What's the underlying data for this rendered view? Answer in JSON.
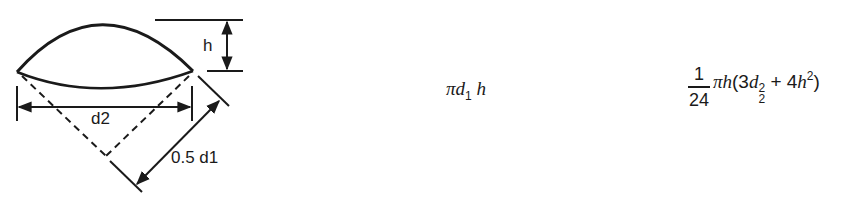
{
  "figure": {
    "labels": {
      "height": "h",
      "chord": "d2",
      "radius": "0.5 d1"
    },
    "stroke_color": "#1a1a1a"
  },
  "formulas": {
    "surface_area": {
      "pi": "π",
      "var_d": "d",
      "d_sub": "1",
      "var_h": "h"
    },
    "volume": {
      "numerator": "1",
      "denominator": "24",
      "pi": "π",
      "var_h": "h",
      "open_paren": "(",
      "coef1": "3",
      "var_d": "d",
      "d_sub": "2",
      "d_sup": "2",
      "plus": " + ",
      "coef2": "4",
      "var_h2": "h",
      "h_sup": "2",
      "close_paren": ")"
    }
  }
}
